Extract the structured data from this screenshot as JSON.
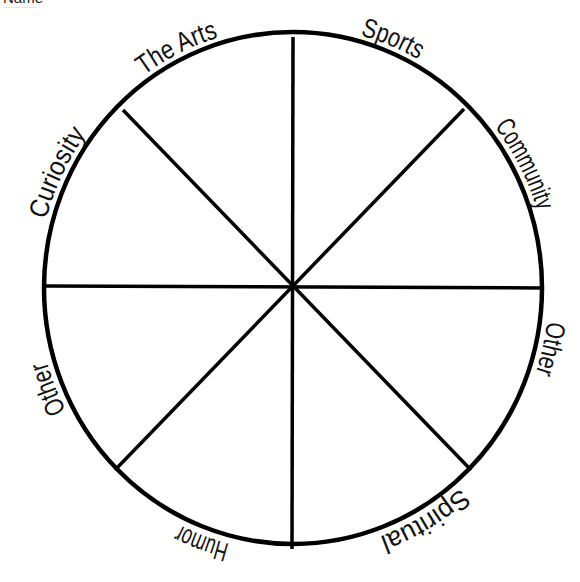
{
  "header": {
    "name_label": "Name"
  },
  "wheel": {
    "center": [
      293,
      288
    ],
    "radius_x": 249,
    "radius_y": 256,
    "stroke_color": "#000000",
    "segments": 8,
    "labels": [
      {
        "text": "The Arts",
        "angle_deg": -26
      },
      {
        "text": "Sports",
        "angle_deg": 22
      },
      {
        "text": "Community",
        "angle_deg": 62
      },
      {
        "text": "Other",
        "angle_deg": 103
      },
      {
        "text": "Spiritual",
        "angle_deg": 150
      },
      {
        "text": "Humor",
        "angle_deg": 200
      },
      {
        "text": "Other",
        "angle_deg": 248
      },
      {
        "text": "Curiosity",
        "angle_deg": 296
      }
    ]
  }
}
